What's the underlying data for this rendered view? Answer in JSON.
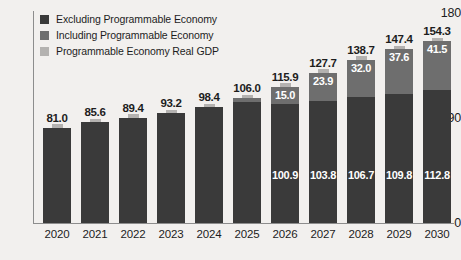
{
  "chart_data": {
    "type": "bar",
    "subtype": "stacked-bar",
    "title": "",
    "xlabel": "",
    "ylabel": "",
    "ylim": [
      0,
      180
    ],
    "yticks": [
      0,
      90,
      180
    ],
    "grid": false,
    "legend_position": "top-left",
    "categories": [
      "2020",
      "2021",
      "2022",
      "2023",
      "2024",
      "2025",
      "2026",
      "2027",
      "2028",
      "2029",
      "2030"
    ],
    "series": [
      {
        "name": "Excluding Programmable Economy",
        "color": "#3a3a3a",
        "values": [
          81.0,
          85.6,
          89.4,
          93.2,
          98.4,
          103.0,
          100.9,
          103.8,
          106.7,
          109.8,
          112.8
        ],
        "labels": [
          "",
          "",
          "",
          "",
          "",
          "",
          "100.9",
          "103.8",
          "106.7",
          "109.8",
          "112.8"
        ]
      },
      {
        "name": "Including Programmable Economy",
        "color": "#6e6e6e",
        "values": [
          0,
          0,
          0,
          0,
          0,
          3.0,
          15.0,
          23.9,
          32.0,
          37.6,
          41.5
        ],
        "labels": [
          "",
          "",
          "",
          "",
          "",
          "",
          "15.0",
          "23.9",
          "32.0",
          "37.6",
          "41.5"
        ]
      },
      {
        "name": "Programmable Economy Real GDP",
        "color": "#b4b2b0",
        "values": [
          3.0,
          3.0,
          3.0,
          3.0,
          3.0,
          3.0,
          3.0,
          3.0,
          3.0,
          3.0,
          3.0
        ],
        "labels": [
          "",
          "",
          "",
          "",
          "",
          "",
          "",
          "",
          "",
          "",
          ""
        ]
      }
    ],
    "totals": [
      81.0,
      85.6,
      89.4,
      93.2,
      98.4,
      106.0,
      115.9,
      127.7,
      138.7,
      147.4,
      154.3
    ],
    "total_labels": [
      "81.0",
      "85.6",
      "89.4",
      "93.2",
      "98.4",
      "106.0",
      "115.9",
      "127.7",
      "138.7",
      "147.4",
      "154.3"
    ]
  },
  "axis": {
    "y_ticks": {
      "top": "180",
      "mid": "90",
      "bottom": "0"
    }
  },
  "legend": {
    "items": [
      {
        "label": "Excluding Programmable Economy",
        "color": "#3a3a3a"
      },
      {
        "label": "Including Programmable Economy",
        "color": "#6e6e6e"
      },
      {
        "label": "Programmable Economy Real GDP",
        "color": "#b4b2b0"
      }
    ]
  },
  "colors": {
    "background": "#f2f0ee",
    "axis": "#8d8d8d",
    "text": "#1d1d1d",
    "value_text": "#ffffff"
  }
}
